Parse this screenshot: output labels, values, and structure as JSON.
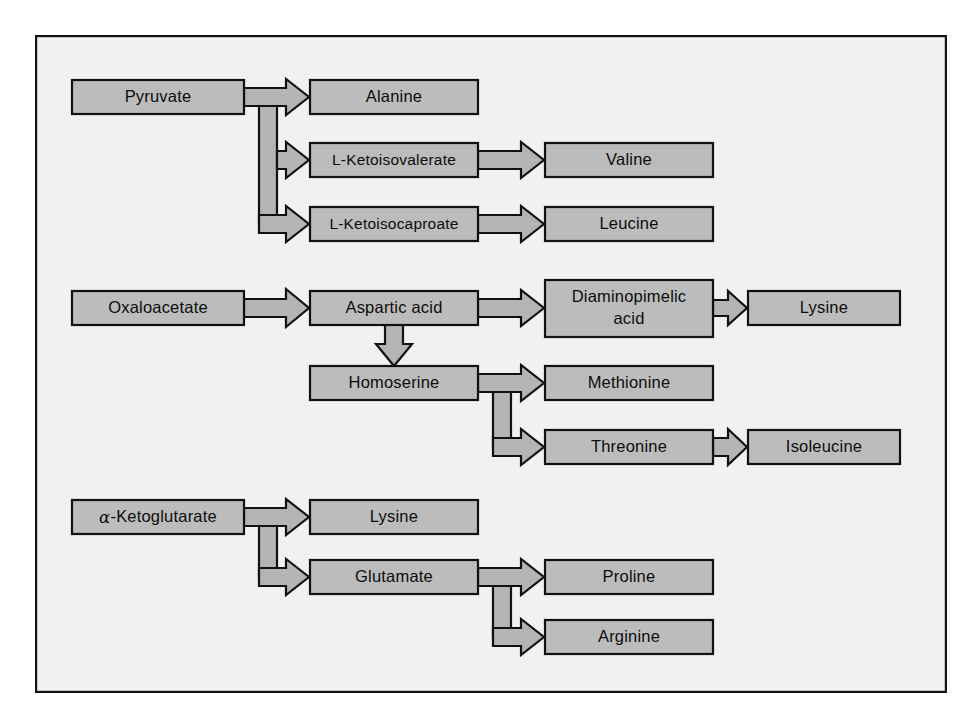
{
  "figure": {
    "background_color": "#f1f1ef",
    "page_color": "#ffffff",
    "node_fill_color": "#bcbcbc",
    "arrow_fill_color": "#b4b4b4",
    "stroke_color": "#111111",
    "frame": {
      "x": 35,
      "y": 35,
      "width": 912,
      "height": 658
    }
  },
  "nodes": {
    "pyruvate": {
      "label": "Pyruvate",
      "x": 72,
      "y": 80,
      "w": 172,
      "h": 34
    },
    "alanine": {
      "label": "Alanine",
      "x": 310,
      "y": 80,
      "w": 168,
      "h": 34
    },
    "ketoisovalerate": {
      "label": "L-Ketoisovalerate",
      "x": 310,
      "y": 143,
      "w": 168,
      "h": 34
    },
    "valine": {
      "label": "Valine",
      "x": 545,
      "y": 143,
      "w": 168,
      "h": 34
    },
    "ketoisocaproate": {
      "label": "L-Ketoisocaproate",
      "x": 310,
      "y": 207,
      "w": 168,
      "h": 34
    },
    "leucine": {
      "label": "Leucine",
      "x": 545,
      "y": 207,
      "w": 168,
      "h": 34
    },
    "oxaloacetate": {
      "label": "Oxaloacetate",
      "x": 72,
      "y": 291,
      "w": 172,
      "h": 34
    },
    "aspartic_acid": {
      "label": "Aspartic acid",
      "x": 310,
      "y": 291,
      "w": 168,
      "h": 34
    },
    "diaminopimelic": {
      "label": "Diaminopimelic acid",
      "label_line1": "Diaminopimelic",
      "label_line2": "acid",
      "x": 545,
      "y": 280,
      "w": 168,
      "h": 57
    },
    "lysine_asp": {
      "label": "Lysine",
      "x": 748,
      "y": 291,
      "w": 152,
      "h": 34
    },
    "homoserine": {
      "label": "Homoserine",
      "x": 310,
      "y": 366,
      "w": 168,
      "h": 34
    },
    "methionine": {
      "label": "Methionine",
      "x": 545,
      "y": 366,
      "w": 168,
      "h": 34
    },
    "threonine": {
      "label": "Threonine",
      "x": 545,
      "y": 430,
      "w": 168,
      "h": 34
    },
    "isoleucine": {
      "label": "Isoleucine",
      "x": 748,
      "y": 430,
      "w": 152,
      "h": 34
    },
    "ketoglutarate": {
      "label": "-Ketoglutarate",
      "alpha_prefix": "α",
      "x": 72,
      "y": 500,
      "w": 172,
      "h": 34
    },
    "lysine_glu": {
      "label": "Lysine",
      "x": 310,
      "y": 500,
      "w": 168,
      "h": 34
    },
    "glutamate": {
      "label": "Glutamate",
      "x": 310,
      "y": 560,
      "w": 168,
      "h": 34
    },
    "proline": {
      "label": "Proline",
      "x": 545,
      "y": 560,
      "w": 168,
      "h": 34
    },
    "arginine": {
      "label": "Arginine",
      "x": 545,
      "y": 620,
      "w": 168,
      "h": 34
    }
  },
  "pathways": [
    {
      "id": "pyruvate-branch",
      "from": "Pyruvate",
      "to": [
        "Alanine",
        "L-Ketoisovalerate",
        "L-Ketoisocaproate"
      ]
    },
    {
      "id": "ketoisovalerate-valine",
      "from": "L-Ketoisovalerate",
      "to": [
        "Valine"
      ]
    },
    {
      "id": "ketoisocaproate-leucine",
      "from": "L-Ketoisocaproate",
      "to": [
        "Leucine"
      ]
    },
    {
      "id": "oxaloacetate-aspartic",
      "from": "Oxaloacetate",
      "to": [
        "Aspartic acid"
      ]
    },
    {
      "id": "aspartic-diaminopimelic",
      "from": "Aspartic acid",
      "to": [
        "Diaminopimelic acid"
      ]
    },
    {
      "id": "diaminopimelic-lysine",
      "from": "Diaminopimelic acid",
      "to": [
        "Lysine"
      ]
    },
    {
      "id": "aspartic-homoserine",
      "from": "Aspartic acid",
      "to": [
        "Homoserine"
      ]
    },
    {
      "id": "homoserine-branch",
      "from": "Homoserine",
      "to": [
        "Methionine",
        "Threonine"
      ]
    },
    {
      "id": "threonine-isoleucine",
      "from": "Threonine",
      "to": [
        "Isoleucine"
      ]
    },
    {
      "id": "ketoglutarate-branch",
      "from": "α-Ketoglutarate",
      "to": [
        "Lysine",
        "Glutamate"
      ]
    },
    {
      "id": "glutamate-branch",
      "from": "Glutamate",
      "to": [
        "Proline",
        "Arginine"
      ]
    }
  ]
}
